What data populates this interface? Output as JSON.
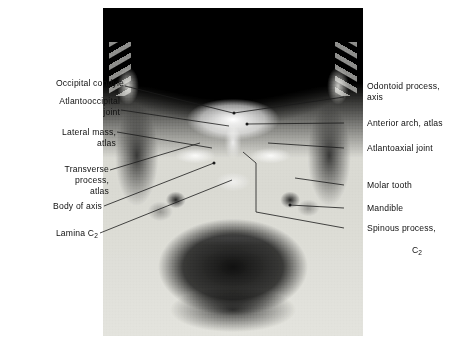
{
  "figure": {
    "type": "annotated-radiograph",
    "modality": "X-ray",
    "view": "open-mouth anteroposterior (odontoid) view of the cervical spine",
    "background_color": "#ffffff",
    "film_tone_color": "#d4d4ce"
  },
  "labels_left": [
    {
      "id": "occipital-condyle",
      "text": "Occipital condyle",
      "align": "right"
    },
    {
      "id": "atlantooccipital-joint",
      "text": "Atlantooccipital\njoint",
      "align": "right"
    },
    {
      "id": "lateral-mass-atlas",
      "text": "Lateral mass,\natlas",
      "align": "right"
    },
    {
      "id": "transverse-process-atlas",
      "text": "Transverse\nprocess,\natlas",
      "align": "right"
    },
    {
      "id": "body-of-axis",
      "text": "Body of axis",
      "align": "right"
    },
    {
      "id": "lamina-c2",
      "text": "Lamina C",
      "subscript": "2",
      "align": "right"
    }
  ],
  "labels_right": [
    {
      "id": "odontoid-process-axis",
      "text": "Odontoid  process,\naxis",
      "align": "left"
    },
    {
      "id": "anterior-arch-atlas",
      "text": "Anterior  arch, atlas",
      "align": "left"
    },
    {
      "id": "atlantoaxial-joint",
      "text": "Atlantoaxial  joint",
      "align": "left"
    },
    {
      "id": "molar-tooth",
      "text": "Molar tooth",
      "align": "left"
    },
    {
      "id": "mandible",
      "text": "Mandible",
      "align": "left"
    },
    {
      "id": "spinous-process-c2",
      "text": "Spinous process,",
      "second_line": "C",
      "subscript": "2",
      "align": "left"
    }
  ],
  "leader_lines": {
    "color": "#1a1a1a",
    "width": 0.8,
    "count": 12
  }
}
